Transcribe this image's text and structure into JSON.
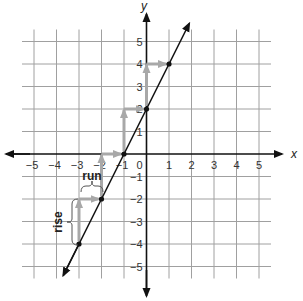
{
  "chart_data": {
    "type": "line",
    "title": "",
    "xlabel": "x",
    "ylabel": "y",
    "xlim": [
      -5,
      5
    ],
    "ylim": [
      -5,
      5
    ],
    "grid": true,
    "x_ticks": [
      "-5",
      "-4",
      "-3",
      "-2",
      "-1",
      "1",
      "2",
      "3",
      "4",
      "5"
    ],
    "y_ticks": [
      "5",
      "4",
      "3",
      "2",
      "1",
      "-1",
      "-2",
      "-3",
      "-4",
      "-5"
    ],
    "origin_label": "0",
    "line": {
      "equation": "y = 2x + 2",
      "slope": 2,
      "intercept": 2
    },
    "points": [
      {
        "x": -3,
        "y": -4
      },
      {
        "x": -2,
        "y": -2
      },
      {
        "x": -1,
        "y": 0
      },
      {
        "x": 0,
        "y": 2
      },
      {
        "x": 1,
        "y": 4
      }
    ],
    "annotations": [
      {
        "text": "rise",
        "description": "vertical brace from (-3,-4) to (-3,-2)"
      },
      {
        "text": "run",
        "description": "horizontal brace from (-3,-2) to (-2,-2)"
      }
    ],
    "colors": {
      "grid": "#9a9a9a",
      "axis": "#111111",
      "line": "#111111",
      "arrows": "#a8a8a8"
    }
  },
  "labels": {
    "x_axis": "x",
    "y_axis": "y",
    "rise": "rise",
    "run": "run",
    "origin": "0"
  }
}
